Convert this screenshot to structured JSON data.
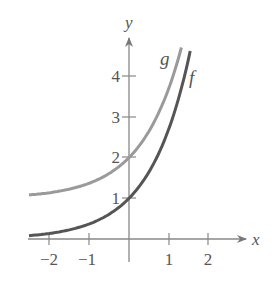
{
  "chart_data": {
    "type": "line",
    "title": "",
    "xlabel": "x",
    "ylabel": "y",
    "xlim": [
      -2.5,
      2.9
    ],
    "ylim": [
      0,
      4.9
    ],
    "xticks": [
      -2,
      -1,
      1,
      2
    ],
    "yticks": [
      1,
      2,
      3,
      4
    ],
    "xtick_labels": [
      "−2",
      "−1",
      "1",
      "2"
    ],
    "ytick_labels": [
      "1",
      "2",
      "3",
      "4"
    ],
    "grid": false,
    "legend": null,
    "series": [
      {
        "name": "f",
        "label": "f",
        "formula": "f(x) = e^x",
        "color": "#555555",
        "x": [
          -2.5,
          -2,
          -1.5,
          -1,
          -0.5,
          0,
          0.5,
          1,
          1.25,
          1.5
        ],
        "y": [
          0.08,
          0.14,
          0.22,
          0.37,
          0.61,
          1.0,
          1.65,
          2.72,
          3.49,
          4.48
        ]
      },
      {
        "name": "g",
        "label": "g",
        "formula": "g(x) = e^x + 1",
        "color": "#9a9a9a",
        "x": [
          -2.5,
          -2,
          -1.5,
          -1,
          -0.5,
          0,
          0.5,
          1,
          1.25
        ],
        "y": [
          1.08,
          1.14,
          1.22,
          1.37,
          1.61,
          2.0,
          2.65,
          3.72,
          4.49
        ]
      }
    ],
    "annotations": [
      {
        "text": "g",
        "near": "top of g curve"
      },
      {
        "text": "f",
        "near": "top of f curve"
      }
    ]
  },
  "labels": {
    "x_axis": "x",
    "y_axis": "y",
    "x_ticks": [
      "−2",
      "−1",
      "1",
      "2"
    ],
    "y_ticks": [
      "1",
      "2",
      "3",
      "4"
    ],
    "curve_f": "f",
    "curve_g": "g"
  }
}
